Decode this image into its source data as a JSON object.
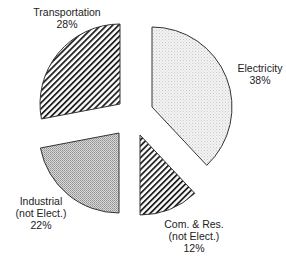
{
  "chart_data": {
    "type": "pie",
    "title": "",
    "exploded": true,
    "start_angle_deg": 0,
    "direction": "clockwise",
    "slices": [
      {
        "name": "Electricity",
        "label_lines": [
          "Electricity",
          "38%"
        ],
        "value": 38,
        "pattern": "light-dots",
        "center": [
          152,
          107
        ],
        "label_pos": [
          260,
          62
        ]
      },
      {
        "name": "Com. & Res. (not Elect.)",
        "label_lines": [
          "Com. & Res.",
          "(not Elect.)",
          "12%"
        ],
        "value": 12,
        "pattern": "diagonal-hatch",
        "center": [
          140,
          135
        ],
        "label_pos": [
          194,
          218
        ]
      },
      {
        "name": "Industrial (not Elect.)",
        "label_lines": [
          "Industrial",
          "(not Elect.)",
          "22%"
        ],
        "value": 22,
        "pattern": "dense-dots",
        "center": [
          119,
          133
        ],
        "label_pos": [
          41,
          195
        ]
      },
      {
        "name": "Transportation",
        "label_lines": [
          "Transportation",
          "28%"
        ],
        "value": 28,
        "pattern": "diagonal-hatch",
        "center": [
          120,
          104
        ],
        "label_pos": [
          67,
          6
        ]
      }
    ],
    "radius": 80,
    "colors": {
      "outline": "#333333",
      "hatch": "#222222",
      "light_fill": "#eeeeee",
      "dense_fill": "#bdbdbd"
    }
  }
}
